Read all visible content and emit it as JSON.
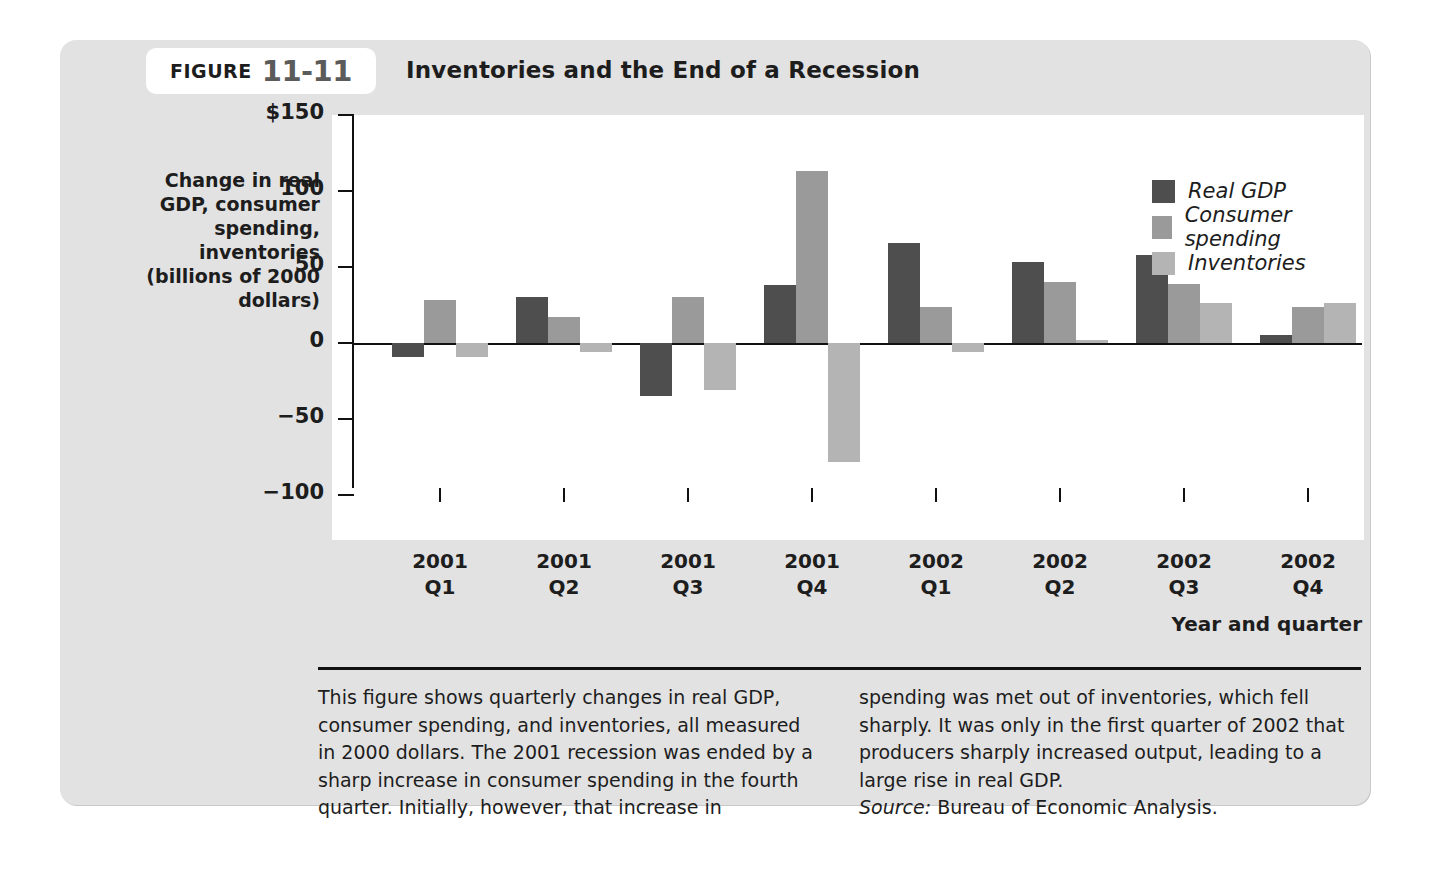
{
  "figure": {
    "label_word": "FIGURE",
    "number": "11-11",
    "title": "Inventories and the End of a Recession"
  },
  "axis": {
    "y_title": "Change in real GDP, consumer spending, inventories (billions of 2000 dollars)",
    "x_title": "Year and quarter"
  },
  "caption": {
    "col1": "This figure shows quarterly changes in real GDP, consumer spending, and inventories, all measured in 2000 dollars. The 2001 recession was ended by a sharp increase in consumer spending in the fourth quarter. Initially, however, that increase in",
    "col2": "spending was met out of inventories, which fell sharply. It was only in the first quarter of 2002 that producers sharply increased output, leading to a large rise in real GDP.",
    "source_word": "Source:",
    "source_text": "Bureau of Economic Analysis."
  },
  "colors": {
    "real_gdp": "#4e4e4e",
    "consumer_spending": "#9a9a9a",
    "inventories": "#b4b4b4",
    "panel": "#e2e2e2",
    "plot_background": "#ffffff",
    "axis": "#111111"
  },
  "chart_data": {
    "type": "bar",
    "title": "Inventories and the End of a Recession",
    "xlabel": "Year and quarter",
    "ylabel": "Change in real GDP, consumer spending, inventories (billions of 2000 dollars)",
    "ylim": [
      -100,
      150
    ],
    "yticks": [
      150,
      100,
      50,
      0,
      -50,
      -100
    ],
    "ytick_labels": [
      "$150",
      "100",
      "50",
      "0",
      "−50",
      "−100"
    ],
    "grid": false,
    "legend_position": "top-right",
    "categories": [
      "2001 Q1",
      "2001 Q2",
      "2001 Q3",
      "2001 Q4",
      "2002 Q1",
      "2002 Q2",
      "2002 Q3",
      "2002 Q4"
    ],
    "category_lines": [
      [
        "2001",
        "Q1"
      ],
      [
        "2001",
        "Q2"
      ],
      [
        "2001",
        "Q3"
      ],
      [
        "2001",
        "Q4"
      ],
      [
        "2002",
        "Q1"
      ],
      [
        "2002",
        "Q2"
      ],
      [
        "2002",
        "Q3"
      ],
      [
        "2002",
        "Q4"
      ]
    ],
    "series": [
      {
        "name": "Real GDP",
        "color": "#4e4e4e",
        "values": [
          -9,
          30,
          -35,
          38,
          66,
          53,
          58,
          5
        ]
      },
      {
        "name": "Consumer spending",
        "color": "#9a9a9a",
        "values": [
          28,
          17,
          30,
          113,
          24,
          40,
          39,
          24
        ]
      },
      {
        "name": "Inventories",
        "color": "#b4b4b4",
        "values": [
          -9,
          -6,
          -31,
          -78,
          -6,
          2,
          26,
          26
        ]
      }
    ]
  }
}
